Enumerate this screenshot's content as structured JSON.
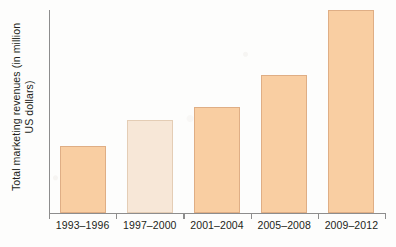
{
  "chart_data": {
    "type": "bar",
    "title": "",
    "subtitle": "",
    "xlabel": "",
    "ylabel": "Total marketing revenues (in million US dollars)",
    "ylabel_line1": "Total marketing revenues (in million",
    "ylabel_line2": "US dollars)",
    "categories": [
      "1993–1996",
      "1997–2000",
      "2001–2004",
      "2005–2008",
      "2009–2012"
    ],
    "values": [
      33,
      46,
      52,
      68,
      100
    ],
    "value_unit": "relative (percent of tallest bar)",
    "ylim": [
      0,
      100
    ],
    "y_ticks": [],
    "y_tick_labels": [],
    "grid": false,
    "legend": false,
    "legend_position": "none",
    "bar_colors": [
      "#f9cea2",
      "#f7e7d7",
      "#f9cea2",
      "#f9cea2",
      "#f9cea2"
    ],
    "bar_border_colors": [
      "#dfae85",
      "#e4cdb5",
      "#dfae85",
      "#dfae85",
      "#dfae85"
    ],
    "highlighted_category": "1997–2000",
    "axis_color": "#8d8d8d",
    "background_color": "#fdfdfc",
    "text_color": "#231f20",
    "annotations": []
  },
  "axes": {
    "y_axis_name": "y-axis",
    "x_axis_name": "x-axis"
  }
}
